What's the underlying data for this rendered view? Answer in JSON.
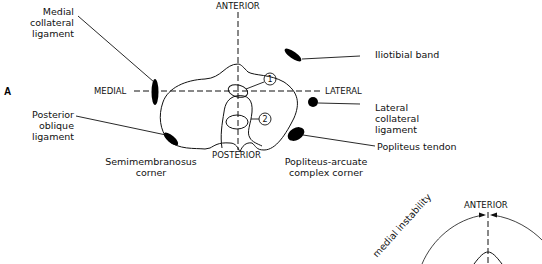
{
  "panel_label": "A",
  "axes": {
    "anterior": "ANTERIOR",
    "posterior": "POSTERIOR",
    "medial": "MEDIAL",
    "lateral": "LATERAL"
  },
  "markers": {
    "one": "1",
    "two": "2"
  },
  "labels": {
    "mcl": [
      "Medial",
      "collateral",
      "ligament"
    ],
    "pol": [
      "Posterior",
      "oblique",
      "ligament"
    ],
    "itb": "Iliotibial band",
    "lcl": [
      "Lateral",
      "collateral",
      "ligament"
    ],
    "popliteus_tendon": "Popliteus tendon",
    "semimembranosus": [
      "Semimembranosus",
      "corner"
    ],
    "popliteus_arcuate": [
      "Popliteus-arcuate",
      "complex corner"
    ]
  },
  "second_diagram": {
    "anterior": "ANTERIOR",
    "rotated_label": "medial instability"
  }
}
